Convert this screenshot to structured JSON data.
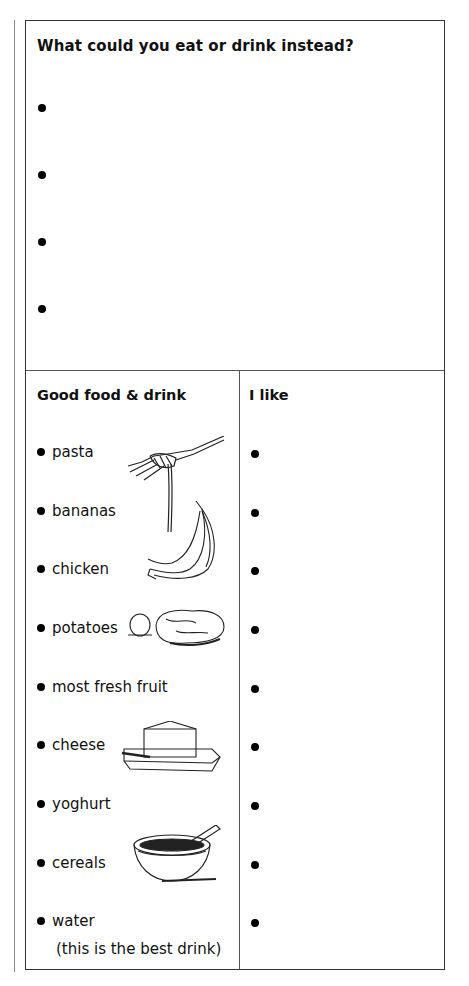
{
  "worksheet": {
    "question": "What could you eat or drink instead?",
    "answer_bullets": 4,
    "left_column": {
      "heading": "Good food & drink",
      "items": [
        {
          "label": "pasta",
          "illustration": "fork-with-pasta-icon"
        },
        {
          "label": "bananas",
          "illustration": "banana-bunch-icon"
        },
        {
          "label": "chicken",
          "illustration": ""
        },
        {
          "label": "potatoes",
          "illustration": "potatoes-icon"
        },
        {
          "label": "most fresh fruit",
          "illustration": ""
        },
        {
          "label": "cheese",
          "illustration": "cheese-on-board-icon"
        },
        {
          "label": "yoghurt",
          "illustration": ""
        },
        {
          "label": "cereals",
          "illustration": "cereal-bowl-icon"
        },
        {
          "label": "water",
          "illustration": ""
        }
      ],
      "water_note": "(this is the best drink)"
    },
    "right_column": {
      "heading": "I like",
      "bullets": 9
    }
  }
}
